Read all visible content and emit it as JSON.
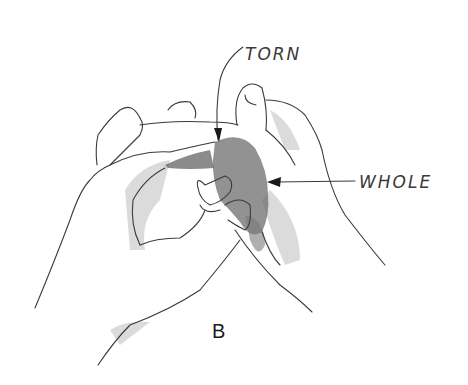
{
  "figure": {
    "panel_letter": "B",
    "labels": {
      "torn": "TORN",
      "whole": "WHOLE"
    },
    "colors": {
      "line": "#3a3a3a",
      "shading": "#8a8a8a",
      "material": "#6e6e6e",
      "background": "#ffffff"
    }
  }
}
